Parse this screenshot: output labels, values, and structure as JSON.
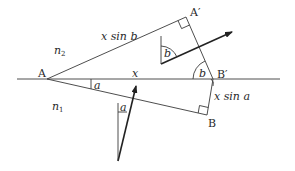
{
  "diagram": {
    "type": "refraction-geometry",
    "labels": {
      "A": "A",
      "A_prime": "A′",
      "B": "B",
      "B_prime": "B′",
      "x": "x",
      "x_sin_b": "x sin b",
      "x_sin_a": "x sin a",
      "n2": "n",
      "n2_sub": "2",
      "n1": "n",
      "n1_sub": "1",
      "angle_a_1": "a",
      "angle_a_2": "a",
      "angle_b_1": "b",
      "angle_b_2": "b"
    },
    "points": {
      "A": [
        47,
        79
      ],
      "A_prime": [
        186,
        17
      ],
      "B_prime": [
        213,
        79
      ],
      "B": [
        207,
        115
      ]
    },
    "colors": {
      "line": "#3a3a3a",
      "arrow": "#222222",
      "background": "#ffffff"
    }
  }
}
